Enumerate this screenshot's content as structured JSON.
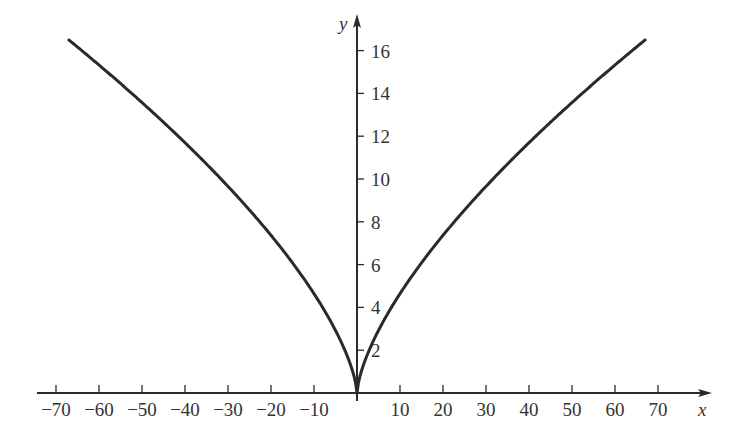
{
  "chart_data": {
    "type": "line",
    "title": "",
    "xlabel": "x",
    "ylabel": "y",
    "function": "y = x^(2/3)",
    "xlim": [
      -67,
      67
    ],
    "ylim": [
      0,
      16.5
    ],
    "grid": false,
    "legend": null,
    "x_ticks": [
      -70,
      -60,
      -50,
      -40,
      -30,
      -20,
      -10,
      10,
      20,
      30,
      40,
      50,
      60,
      70
    ],
    "x_tick_labels": [
      "−70",
      "−60",
      "−50",
      "−40",
      "−30",
      "−20",
      "−10",
      "10",
      "20",
      "30",
      "40",
      "50",
      "60",
      "70"
    ],
    "y_ticks": [
      2,
      4,
      6,
      8,
      10,
      12,
      14,
      16
    ],
    "y_tick_labels": [
      "2",
      "4",
      "6",
      "8",
      "10",
      "12",
      "14",
      "16"
    ],
    "series": [
      {
        "name": "y = x^(2/3)",
        "x": [
          -67,
          -64,
          -50,
          -40,
          -30,
          -20,
          -10,
          -5,
          -1,
          0,
          1,
          5,
          10,
          20,
          30,
          40,
          50,
          64,
          67
        ],
        "y": [
          16.5,
          16,
          13.6,
          11.7,
          9.7,
          7.4,
          4.6,
          2.9,
          1,
          0,
          1,
          2.9,
          4.6,
          7.4,
          9.7,
          11.7,
          13.6,
          16,
          16.5
        ]
      }
    ]
  },
  "layout": {
    "origin_px": [
      357,
      393
    ],
    "px_per_x_unit": 4.3,
    "px_per_y_unit": 21.4,
    "x_axis_px": [
      37,
      712
    ],
    "y_axis_top_px": 14,
    "curve_color": "#2a2a2a",
    "axis_color": "#2a2a2a"
  }
}
